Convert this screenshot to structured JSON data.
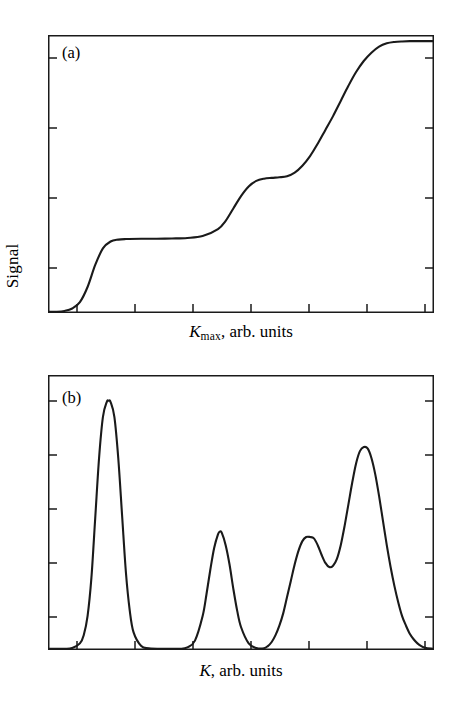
{
  "figure": {
    "ylabel": "Signal",
    "background": "#ffffff",
    "ink_color": "#1a1a1a"
  },
  "panels": [
    {
      "tag": "(a)",
      "xlabel_symbol": "K",
      "xlabel_subscript": "max",
      "xlabel_rest": ", arb. units",
      "xlabel_plain": "Kmax, arb. units"
    },
    {
      "tag": "(b)",
      "xlabel_symbol": "K",
      "xlabel_subscript": "",
      "xlabel_rest": ", arb. units",
      "xlabel_plain": "K, arb. units"
    }
  ],
  "chart_data": [
    {
      "type": "line",
      "title": "(a)",
      "xlabel": "Kmax, arb. units",
      "ylabel": "Signal",
      "grid": false,
      "legend": null,
      "xlim": [
        0,
        100
      ],
      "ylim": [
        0,
        100
      ],
      "x_ticks": [
        7.5,
        22.5,
        37.5,
        52.5,
        67.5,
        82.5,
        97.5
      ],
      "y_ticks": [
        8,
        33,
        58,
        92
      ],
      "x_tick_labels": [],
      "y_tick_labels": [],
      "description": "Cumulative step-like (integrated) signal rising through three plateaus",
      "series": [
        {
          "name": "integrated signal",
          "x": [
            0,
            2,
            4,
            6,
            8,
            10,
            12,
            14,
            16,
            18,
            20,
            24,
            28,
            32,
            36,
            40,
            44,
            46,
            48,
            50,
            52,
            54,
            56,
            58,
            60,
            62,
            64,
            66,
            68,
            70,
            72,
            74,
            76,
            78,
            80,
            82,
            84,
            86,
            88,
            90,
            92,
            94,
            96,
            98,
            100
          ],
          "y": [
            0,
            0,
            0.3,
            1.2,
            3.5,
            9,
            17,
            23,
            25.5,
            26.2,
            26.4,
            26.5,
            26.5,
            26.6,
            26.8,
            27.5,
            30,
            33,
            37.5,
            42,
            45.5,
            47.5,
            48.3,
            48.6,
            48.8,
            49.2,
            50.5,
            53,
            56.5,
            61,
            66,
            71,
            76.5,
            82,
            87,
            91,
            94,
            96.2,
            97.4,
            97.9,
            98.1,
            98.2,
            98.2,
            98.2,
            98.2
          ]
        }
      ]
    },
    {
      "type": "line",
      "title": "(b)",
      "xlabel": "K, arb. units",
      "ylabel": "Signal",
      "grid": false,
      "legend": null,
      "xlim": [
        0,
        100
      ],
      "ylim": [
        0,
        100
      ],
      "x_ticks": [
        7.5,
        22.5,
        37.5,
        52.5,
        67.5,
        82.5,
        97.5
      ],
      "y_ticks": [
        10,
        30,
        50,
        70,
        90
      ],
      "x_tick_labels": [],
      "y_tick_labels": [],
      "description": "Derivative spectrum with four resolved peaks; peak 1 tall and narrow, peak 2 medium, peak 3 a shoulder on peak 4",
      "peaks": [
        {
          "name": "peak-1",
          "center": 15.5,
          "height": 91,
          "width": 4.2
        },
        {
          "name": "peak-2",
          "center": 44.5,
          "height": 43,
          "width": 5.2
        },
        {
          "name": "peak-3",
          "center": 69.0,
          "height": 41,
          "width": 5.5
        },
        {
          "name": "peak-4",
          "center": 83.0,
          "height": 74,
          "width": 6.0
        }
      ],
      "series": [
        {
          "name": "signal",
          "x": [
            0,
            4,
            6,
            8,
            9,
            10,
            11,
            12,
            13,
            14,
            15,
            15.5,
            16,
            17,
            18,
            19,
            20,
            21,
            22,
            24,
            26,
            30,
            34,
            36,
            38,
            40,
            41,
            42,
            43,
            44,
            44.5,
            45,
            46,
            47,
            48,
            49,
            50,
            52,
            54,
            56,
            57,
            58,
            59,
            60,
            61,
            62,
            63,
            64,
            65,
            66,
            67,
            68,
            69,
            70,
            71,
            72,
            73,
            74,
            75,
            76,
            77,
            78,
            79,
            80,
            81,
            82,
            83,
            84,
            85,
            86,
            87,
            88,
            89,
            90,
            91,
            92,
            93,
            94,
            95,
            96,
            97,
            98,
            100
          ],
          "y": [
            0,
            0,
            0.3,
            2,
            5,
            12,
            26,
            48,
            70,
            85,
            90.5,
            91,
            90.5,
            85,
            70,
            49,
            28,
            14,
            6,
            1,
            0.2,
            0,
            0,
            0.5,
            3,
            12,
            20,
            29,
            37,
            42,
            43,
            42.5,
            38,
            31,
            22,
            14,
            8,
            2,
            0.3,
            0.2,
            1,
            2.5,
            5,
            8.5,
            13,
            19,
            25,
            31,
            36,
            39.5,
            41,
            41,
            40.5,
            38,
            34.5,
            31.5,
            30,
            30.5,
            33,
            38,
            45,
            53,
            61,
            68,
            72.5,
            74,
            73.5,
            70,
            64,
            56,
            47,
            38,
            30,
            23,
            17,
            12,
            8.5,
            5.5,
            3.5,
            2,
            1,
            0.4,
            0
          ]
        }
      ]
    }
  ]
}
